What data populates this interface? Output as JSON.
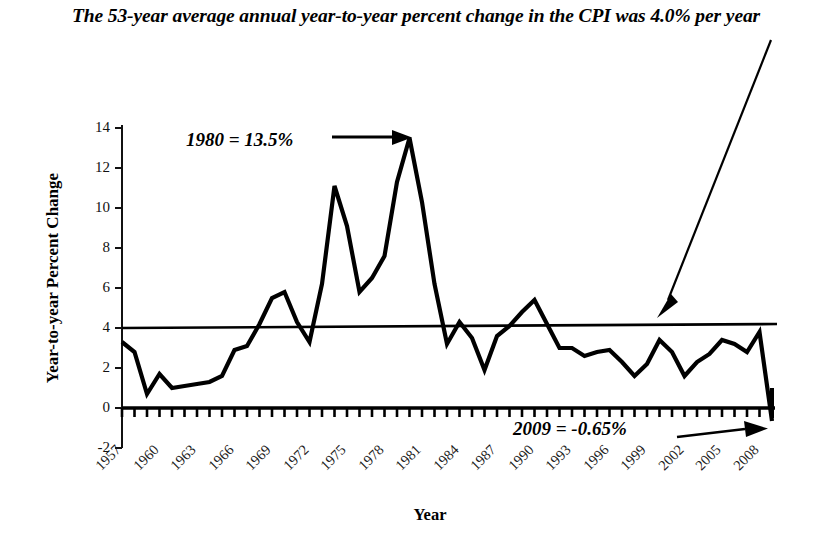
{
  "chart_data": {
    "type": "line",
    "title": "The 53-year average annual year-to-year percent change in the CPI was 4.0% per year",
    "xlabel": "Year",
    "ylabel": "Year-to-year Percent Change",
    "ylim": [
      -2,
      14
    ],
    "yticks": [
      -2,
      0,
      2,
      4,
      6,
      8,
      10,
      12,
      14
    ],
    "ytick_labels": [
      "-2",
      "0",
      "2",
      "4",
      "6",
      "8",
      "10",
      "12",
      "14"
    ],
    "xlim": [
      1957,
      2009
    ],
    "xtick_labels": [
      "1957",
      "1960",
      "1963",
      "1966",
      "1969",
      "1972",
      "1975",
      "1978",
      "1981",
      "1984",
      "1987",
      "1990",
      "1993",
      "1996",
      "1999",
      "2002",
      "2005",
      "2008"
    ],
    "xtick_step": 3,
    "minor_tick_step": 1,
    "grid": false,
    "legend": "none",
    "line_color": "#000000",
    "reference_line": {
      "label": "4.0% average",
      "value": 4.0,
      "color": "#000000"
    },
    "x": [
      1957,
      1958,
      1959,
      1960,
      1961,
      1962,
      1963,
      1964,
      1965,
      1966,
      1967,
      1968,
      1969,
      1970,
      1971,
      1972,
      1973,
      1974,
      1975,
      1976,
      1977,
      1978,
      1979,
      1980,
      1981,
      1982,
      1983,
      1984,
      1985,
      1986,
      1987,
      1988,
      1989,
      1990,
      1991,
      1992,
      1993,
      1994,
      1995,
      1996,
      1997,
      1998,
      1999,
      2000,
      2001,
      2002,
      2003,
      2004,
      2005,
      2006,
      2007,
      2008,
      2009
    ],
    "values": [
      3.3,
      2.8,
      0.7,
      1.7,
      1.0,
      1.1,
      1.2,
      1.3,
      1.6,
      2.9,
      3.1,
      4.2,
      5.5,
      5.8,
      4.3,
      3.3,
      6.2,
      11.1,
      9.1,
      5.8,
      6.5,
      7.6,
      11.3,
      13.5,
      10.3,
      6.2,
      3.2,
      4.3,
      3.5,
      1.9,
      3.6,
      4.1,
      4.8,
      5.4,
      4.2,
      3.0,
      3.0,
      2.6,
      2.8,
      2.9,
      2.3,
      1.6,
      2.2,
      3.4,
      2.8,
      1.6,
      2.3,
      2.7,
      3.4,
      3.2,
      2.8,
      3.8,
      -0.65
    ]
  },
  "title": {
    "text": "The 53-year average annual year-to-year percent change in the CPI was 4.0% per year"
  },
  "axes": {
    "ylabel": "Year-to-year Percent Change",
    "xlabel": "Year"
  },
  "annotations": {
    "peak": "1980 = 13.5%",
    "trough": "2009 = -0.65%"
  }
}
